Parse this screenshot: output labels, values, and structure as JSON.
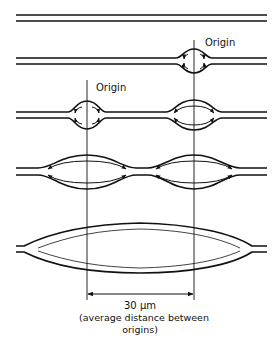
{
  "diagram": {
    "labels": {
      "origin_right": "Origin",
      "origin_left": "Origin",
      "distance_value": "30 μm",
      "distance_caption_line1": "(average distance between",
      "distance_caption_line2": "origins)"
    },
    "stages": [
      {
        "stage": 1,
        "description": "Unreplicated double-stranded DNA"
      },
      {
        "stage": 2,
        "description": "Replication bubble at right origin"
      },
      {
        "stage": 3,
        "description": "Bubbles at both origins, bidirectional forks"
      },
      {
        "stage": 4,
        "description": "Bubbles enlarging"
      },
      {
        "stage": 5,
        "description": "Bubbles fused into one large bubble"
      }
    ],
    "colors": {
      "ink": "#111111",
      "background": "#ffffff"
    }
  }
}
